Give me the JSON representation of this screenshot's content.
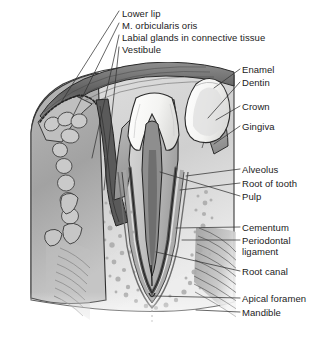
{
  "figure": {
    "type": "anatomical-illustration",
    "style": "grayscale medical line drawing",
    "background_color": "#ffffff",
    "ink_color": "#1b1b1b"
  },
  "palette": {
    "enamel": "#fbfbfa",
    "dentin": "#c9c9c9",
    "pulp": "#8f8f8f",
    "gingiva": "#b0b0b0",
    "lip_skin": "#a8a8a8",
    "orbicularis": "#6f6f6f",
    "gland": "#cfcfcf",
    "bone": "#d8d8d8",
    "spongy_bone": "#bdbdbd",
    "cementum": "#6b6b6b",
    "periodontal": "#9a9a9a",
    "muscle": "#8a8a8a",
    "outline": "#2a2a2a"
  },
  "labels": {
    "top_left": [
      {
        "id": "lower-lip",
        "text": "Lower lip",
        "x": 122,
        "y": 14
      },
      {
        "id": "orbicularis-oris",
        "text": "M. orbicularis oris",
        "x": 122,
        "y": 26
      },
      {
        "id": "labial-glands",
        "text": "Labial glands in connective tissue",
        "x": 122,
        "y": 38
      },
      {
        "id": "vestibule",
        "text": "Vestibule",
        "x": 122,
        "y": 50
      }
    ],
    "right": [
      {
        "id": "enamel",
        "text": "Enamel",
        "x": 242,
        "y": 72
      },
      {
        "id": "dentin",
        "text": "Dentin",
        "x": 242,
        "y": 85
      },
      {
        "id": "crown",
        "text": "Crown",
        "x": 242,
        "y": 109
      },
      {
        "id": "gingiva",
        "text": "Gingiva",
        "x": 242,
        "y": 129
      },
      {
        "id": "alveolus",
        "text": "Alveolus",
        "x": 242,
        "y": 172
      },
      {
        "id": "root-of-tooth",
        "text": "Root of tooth",
        "x": 242,
        "y": 186
      },
      {
        "id": "pulp",
        "text": "Pulp",
        "x": 242,
        "y": 199
      },
      {
        "id": "cementum",
        "text": "Cementum",
        "x": 242,
        "y": 230
      },
      {
        "id": "periodontal-ligament",
        "text": "Periodontal ligament",
        "x": 242,
        "y": 243
      },
      {
        "id": "root-canal",
        "text": "Root canal",
        "x": 242,
        "y": 274
      },
      {
        "id": "apical-foramen",
        "text": "Apical foramen",
        "x": 242,
        "y": 301
      },
      {
        "id": "mandible",
        "text": "Mandible",
        "x": 242,
        "y": 315
      }
    ]
  },
  "leader_lines": {
    "count": 16,
    "color": "#333333",
    "width": 0.7
  }
}
